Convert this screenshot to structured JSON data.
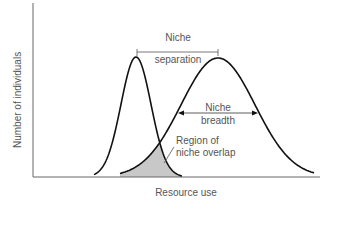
{
  "diagram": {
    "axes": {
      "x_label": "Resource use",
      "y_label": "Number of individuals"
    },
    "curves": [
      {
        "name": "species-a",
        "shape": "narrow bell curve",
        "peak_x": 136,
        "peak_y": 57,
        "sigma": 15
      },
      {
        "name": "species-b",
        "shape": "wide bell curve",
        "peak_x": 218,
        "peak_y": 58,
        "sigma": 37
      }
    ],
    "annotations": {
      "separation_line1": "Niche",
      "separation_line2": "separation",
      "breadth_line1": "Niche",
      "breadth_line2": "breadth",
      "overlap_line1": "Region of",
      "overlap_line2": "niche overlap"
    },
    "colors": {
      "line": "#111111",
      "axis": "#666666",
      "overlap_fill": "#c8c8c8",
      "text": "#555555"
    }
  }
}
